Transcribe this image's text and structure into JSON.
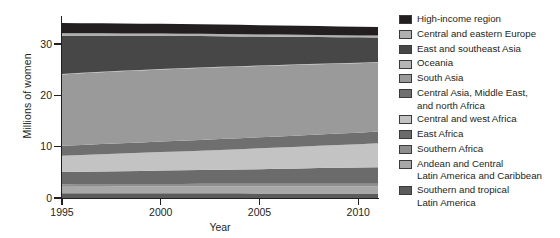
{
  "chart_data": {
    "type": "area",
    "stacked": true,
    "title": "",
    "xlabel": "Year",
    "ylabel": "Millions of women",
    "x": [
      1995,
      1996,
      1997,
      1998,
      1999,
      2000,
      2001,
      2002,
      2003,
      2004,
      2005,
      2006,
      2007,
      2008,
      2009,
      2010,
      2011
    ],
    "xlim": [
      1995,
      2011
    ],
    "ylim": [
      0,
      35.5
    ],
    "xticks": [
      1995,
      2000,
      2005,
      2010
    ],
    "xticklabels": [
      "1995",
      "2000",
      "2005",
      "2010"
    ],
    "yticks": [
      0,
      10,
      20,
      30
    ],
    "yticklabels": [
      "0",
      "10",
      "20",
      "30"
    ],
    "grid": false,
    "legend_position": "right",
    "series": [
      {
        "name": "Southern and tropical Latin America",
        "color": "#5b5b5b",
        "values": [
          0.95,
          0.95,
          0.94,
          0.94,
          0.93,
          0.93,
          0.92,
          0.92,
          0.91,
          0.91,
          0.9,
          0.9,
          0.9,
          0.89,
          0.89,
          0.88,
          0.88
        ]
      },
      {
        "name": "Andean and Central Latin America and Caribbean",
        "color": "#a8a8a8",
        "values": [
          1.25,
          1.26,
          1.27,
          1.28,
          1.29,
          1.3,
          1.31,
          1.31,
          1.32,
          1.33,
          1.33,
          1.34,
          1.34,
          1.35,
          1.35,
          1.36,
          1.36
        ]
      },
      {
        "name": "Southern Africa",
        "color": "#8e8e8e",
        "values": [
          0.5,
          0.5,
          0.51,
          0.51,
          0.52,
          0.52,
          0.52,
          0.53,
          0.53,
          0.53,
          0.54,
          0.54,
          0.54,
          0.55,
          0.55,
          0.55,
          0.56
        ]
      },
      {
        "name": "East Africa",
        "color": "#6b6b6b",
        "values": [
          2.35,
          2.4,
          2.45,
          2.5,
          2.55,
          2.6,
          2.65,
          2.7,
          2.75,
          2.8,
          2.86,
          2.92,
          2.98,
          3.04,
          3.1,
          3.16,
          3.22
        ]
      },
      {
        "name": "Central and west Africa",
        "color": "#c3c3c3",
        "values": [
          3.2,
          3.28,
          3.36,
          3.44,
          3.52,
          3.6,
          3.69,
          3.78,
          3.87,
          3.96,
          4.05,
          4.15,
          4.25,
          4.35,
          4.45,
          4.55,
          4.66
        ]
      },
      {
        "name": "Central Asia, Middle East, and north Africa",
        "color": "#6f6f6f",
        "values": [
          1.95,
          1.97,
          1.99,
          2.01,
          2.03,
          2.05,
          2.07,
          2.09,
          2.11,
          2.13,
          2.15,
          2.17,
          2.19,
          2.21,
          2.23,
          2.25,
          2.27
        ]
      },
      {
        "name": "South Asia",
        "color": "#9a9a9a",
        "values": [
          13.9,
          13.95,
          14.0,
          14.02,
          14.05,
          14.06,
          14.05,
          14.03,
          14.0,
          13.96,
          13.9,
          13.84,
          13.77,
          13.7,
          13.62,
          13.54,
          13.46
        ]
      },
      {
        "name": "Oceania",
        "color": "#b5b5b5",
        "values": [
          0.1,
          0.1,
          0.1,
          0.1,
          0.1,
          0.1,
          0.1,
          0.1,
          0.1,
          0.1,
          0.1,
          0.1,
          0.1,
          0.1,
          0.1,
          0.1,
          0.1
        ]
      },
      {
        "name": "East and southeast Asia",
        "color": "#474747",
        "values": [
          7.4,
          7.2,
          7.0,
          6.8,
          6.62,
          6.45,
          6.28,
          6.12,
          5.96,
          5.8,
          5.65,
          5.5,
          5.36,
          5.22,
          5.08,
          4.95,
          4.82
        ]
      },
      {
        "name": "Central and eastern Europe",
        "color": "#b0b0b0",
        "values": [
          0.52,
          0.51,
          0.5,
          0.49,
          0.48,
          0.47,
          0.46,
          0.45,
          0.44,
          0.43,
          0.42,
          0.41,
          0.4,
          0.39,
          0.38,
          0.37,
          0.36
        ]
      },
      {
        "name": "High-income region",
        "color": "#231f20",
        "values": [
          2.0,
          1.98,
          1.96,
          1.94,
          1.92,
          1.9,
          1.88,
          1.86,
          1.84,
          1.82,
          1.8,
          1.78,
          1.76,
          1.74,
          1.72,
          1.7,
          1.68
        ]
      }
    ]
  },
  "axes": {
    "ylabel": "Millions of women",
    "xlabel": "Year",
    "yticklabels": [
      "30",
      "20",
      "10",
      "0"
    ],
    "xticklabels": [
      "1995",
      "2000",
      "2005",
      "2010"
    ]
  },
  "legend": {
    "entries": [
      {
        "label": "High-income region",
        "color": "#231f20",
        "lines": [
          "High-income region"
        ]
      },
      {
        "label": "Central and eastern Europe",
        "color": "#b0b0b0",
        "lines": [
          "Central and eastern Europe"
        ]
      },
      {
        "label": "East and southeast Asia",
        "color": "#474747",
        "lines": [
          "East and southeast Asia"
        ]
      },
      {
        "label": "Oceania",
        "color": "#b5b5b5",
        "lines": [
          "Oceania"
        ]
      },
      {
        "label": "South Asia",
        "color": "#9a9a9a",
        "lines": [
          "South Asia"
        ]
      },
      {
        "label": "Central Asia, Middle East, and north Africa",
        "color": "#6f6f6f",
        "lines": [
          "Central Asia, Middle East,",
          "and north Africa"
        ]
      },
      {
        "label": "Central and west Africa",
        "color": "#c3c3c3",
        "lines": [
          "Central and west Africa"
        ]
      },
      {
        "label": "East Africa",
        "color": "#6b6b6b",
        "lines": [
          "East Africa"
        ]
      },
      {
        "label": "Southern Africa",
        "color": "#8e8e8e",
        "lines": [
          "Southern Africa"
        ]
      },
      {
        "label": "Andean and Central Latin America and Caribbean",
        "color": "#a8a8a8",
        "lines": [
          "Andean and Central",
          "Latin America and Caribbean"
        ]
      },
      {
        "label": "Southern and tropical Latin America",
        "color": "#5b5b5b",
        "lines": [
          "Southern and tropical",
          "Latin America"
        ]
      }
    ]
  }
}
